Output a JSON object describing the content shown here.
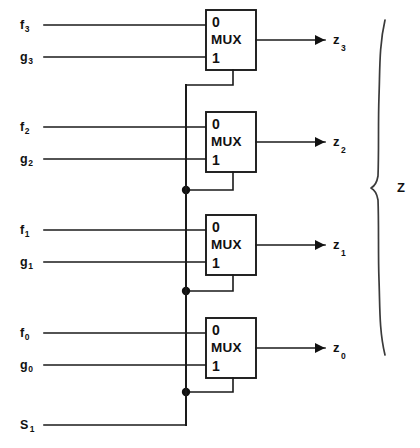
{
  "diagram": {
    "bundle_label": "Z",
    "select_signal": {
      "name": "S",
      "subscript": "1"
    },
    "mux_label": "MUX",
    "port_label_0": "0",
    "port_label_1": "1",
    "colors": {
      "line": "#1a1a1a",
      "text": "#111111",
      "brace": "#3a3a3a",
      "background": "#ffffff"
    },
    "blocks": [
      {
        "index": 0,
        "mux_label": "MUX",
        "port0": "0",
        "port1": "1",
        "input_a": {
          "name": "f",
          "subscript": "3"
        },
        "input_b": {
          "name": "g",
          "subscript": "3"
        },
        "output": {
          "name": "z",
          "subscript": "3"
        }
      },
      {
        "index": 1,
        "mux_label": "MUX",
        "port0": "0",
        "port1": "1",
        "input_a": {
          "name": "f",
          "subscript": "2"
        },
        "input_b": {
          "name": "g",
          "subscript": "2"
        },
        "output": {
          "name": "z",
          "subscript": "2"
        }
      },
      {
        "index": 2,
        "mux_label": "MUX",
        "port0": "0",
        "port1": "1",
        "input_a": {
          "name": "f",
          "subscript": "1"
        },
        "input_b": {
          "name": "g",
          "subscript": "1"
        },
        "output": {
          "name": "z",
          "subscript": "1"
        }
      },
      {
        "index": 3,
        "mux_label": "MUX",
        "port0": "0",
        "port1": "1",
        "input_a": {
          "name": "f",
          "subscript": "0"
        },
        "input_b": {
          "name": "g",
          "subscript": "0"
        },
        "output": {
          "name": "z",
          "subscript": "0"
        }
      }
    ]
  }
}
